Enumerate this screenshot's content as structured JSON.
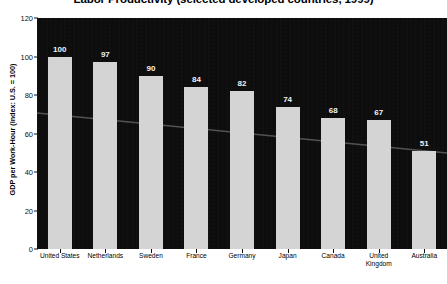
{
  "chart_data": {
    "type": "bar",
    "title": "Labor Productivity (selected developed countries, 1999)",
    "xlabel": "",
    "ylabel": "GDP per Work-Hour (index: U.S. = 100)",
    "categories": [
      "United States",
      "Netherlands",
      "Sweden",
      "France",
      "Germany",
      "Japan",
      "Canada",
      "United Kingdom",
      "Australia"
    ],
    "values": [
      100,
      97,
      90,
      84,
      82,
      74,
      68,
      67,
      51
    ],
    "ylim": [
      0,
      120
    ],
    "yticks": [
      0,
      20,
      40,
      60,
      80,
      100,
      120
    ],
    "ytick_labels": [
      "0",
      "20",
      "40",
      "60",
      "80",
      "100",
      "120"
    ],
    "grid": false,
    "legend": "none",
    "annotations": [
      "faint descending trend line across plot"
    ],
    "colors": {
      "plot_background": "#0a0a0a",
      "bar_fill": "#d4d4d4",
      "value_label": "#f2f2f2",
      "axis_text": "#000000",
      "page_background": "#ffffff",
      "trend_line": "#8a8a8a"
    }
  }
}
